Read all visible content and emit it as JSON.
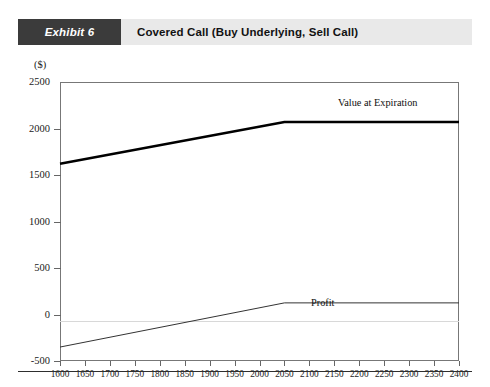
{
  "exhibit": {
    "tag": "Exhibit 6",
    "title": "Covered Call (Buy Underlying, Sell Call)"
  },
  "chart_data": {
    "type": "line",
    "title": "Covered Call (Buy Underlying, Sell Call)",
    "xlabel": "Value of Underlying at Expiration (S",
    "xlabel_sub": "T",
    "xlabel_tail": ")",
    "ylabel": "($)",
    "xlim": [
      1600,
      2400
    ],
    "ylim": [
      -500,
      2500
    ],
    "grid": false,
    "legend_position": "inline-annotations",
    "xticks": [
      1600,
      1650,
      1700,
      1750,
      1800,
      1850,
      1900,
      1950,
      2000,
      2050,
      2100,
      2150,
      2200,
      2250,
      2300,
      2350,
      2400
    ],
    "yticks": [
      -500,
      0,
      500,
      1000,
      1500,
      2000,
      2500
    ],
    "strike": 2050,
    "series": [
      {
        "name": "Value at Expiration",
        "label": "Value at Expiration",
        "color": "#000000",
        "width": 2.6,
        "x": [
          1600,
          2050,
          2400
        ],
        "values": [
          1620,
          2070,
          2070
        ]
      },
      {
        "name": "Profit",
        "label": "Profit",
        "color": "#333333",
        "width": 1.0,
        "x": [
          1600,
          2050,
          2400
        ],
        "values": [
          -350,
          125,
          125
        ]
      }
    ]
  }
}
